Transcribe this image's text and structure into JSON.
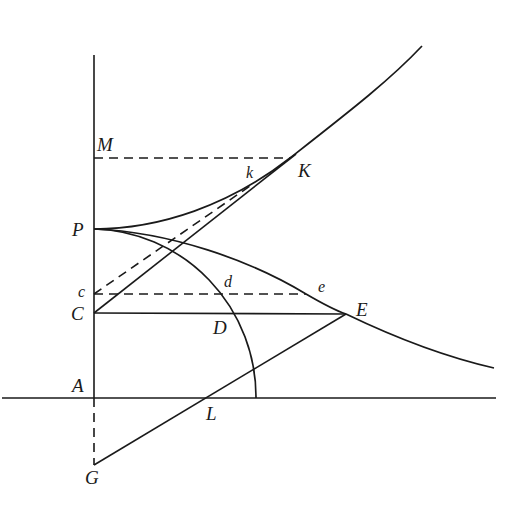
{
  "diagram": {
    "type": "geometric-construction",
    "background": "#ffffff",
    "ink_color": "#1a1a1a",
    "points": {
      "A": [
        94,
        398
      ],
      "P": [
        94,
        229
      ],
      "M": [
        94,
        158
      ],
      "c": [
        94,
        293
      ],
      "C": [
        94,
        313
      ],
      "G": [
        94,
        465
      ],
      "K": [
        290,
        158
      ],
      "k": [
        244,
        190
      ],
      "d": [
        222,
        293
      ],
      "D": [
        235,
        313
      ],
      "e": [
        306,
        294
      ],
      "E": [
        346,
        314
      ],
      "L": [
        206,
        398
      ]
    },
    "labels": [
      {
        "text": "M",
        "x": 97,
        "y": 151,
        "size": "big"
      },
      {
        "text": "k",
        "x": 246,
        "y": 178,
        "size": "small"
      },
      {
        "text": "K",
        "x": 298,
        "y": 177,
        "size": "big"
      },
      {
        "text": "P",
        "x": 72,
        "y": 236,
        "size": "big"
      },
      {
        "text": "c",
        "x": 78,
        "y": 297,
        "size": "small"
      },
      {
        "text": "d",
        "x": 224,
        "y": 287,
        "size": "small"
      },
      {
        "text": "e",
        "x": 318,
        "y": 292,
        "size": "small"
      },
      {
        "text": "C",
        "x": 71,
        "y": 320,
        "size": "big"
      },
      {
        "text": "E",
        "x": 356,
        "y": 316,
        "size": "big"
      },
      {
        "text": "D",
        "x": 213,
        "y": 334,
        "size": "big"
      },
      {
        "text": "A",
        "x": 72,
        "y": 392,
        "size": "big"
      },
      {
        "text": "L",
        "x": 206,
        "y": 420,
        "size": "big"
      },
      {
        "text": "G",
        "x": 85,
        "y": 484,
        "size": "big"
      }
    ],
    "lines": [
      {
        "name": "vertical-axis",
        "style": "solid",
        "from": [
          94,
          55
        ],
        "to": [
          94,
          398
        ]
      },
      {
        "name": "horizontal-axis",
        "style": "solid",
        "from": [
          2,
          398
        ],
        "to": [
          496,
          398
        ]
      },
      {
        "name": "line-AG",
        "style": "dashed",
        "from": [
          94,
          398
        ],
        "to": [
          94,
          465
        ]
      },
      {
        "name": "line-MK",
        "style": "dashed",
        "from": [
          94,
          158
        ],
        "to": [
          290,
          158
        ]
      },
      {
        "name": "line-ce",
        "style": "dashed",
        "from": [
          94,
          294
        ],
        "to": [
          306,
          294
        ]
      },
      {
        "name": "line-ck",
        "style": "dashed",
        "from": [
          94,
          294
        ],
        "to": [
          250,
          186
        ]
      },
      {
        "name": "line-CE",
        "style": "solid",
        "from": [
          94,
          313
        ],
        "to": [
          346,
          314
        ]
      },
      {
        "name": "line-CK",
        "style": "solid",
        "from": [
          94,
          313
        ],
        "to": [
          296,
          154
        ]
      },
      {
        "name": "line-GE",
        "style": "solid",
        "from": [
          94,
          465
        ],
        "to": [
          346,
          314
        ]
      }
    ],
    "curves": [
      {
        "name": "upper-curve-PK",
        "path": "M 94 229 C 160 229, 230 205, 290 158 S 390 80, 422 46"
      },
      {
        "name": "lower-curve-PE",
        "path": "M 94 229 C 170 232, 250 260, 306 294 C 330 308, 340 312, 346 314 C 400 340, 450 358, 494 368"
      },
      {
        "name": "quarter-circle-arc",
        "path": "M 94 229 A 166 168 0 0 1 256 398"
      }
    ]
  }
}
